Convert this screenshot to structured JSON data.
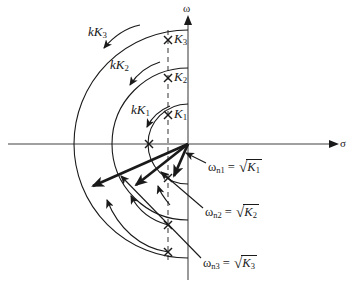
{
  "figure": {
    "kind": "root-locus-s-plane",
    "background_color": "#ffffff",
    "line_color": "#1a1a1a",
    "axis_color": "#808080",
    "axes": {
      "real_axis_label": "σ",
      "imag_axis_label": "ω",
      "origin": {
        "x": 188,
        "y": 144
      },
      "real_axis_arrow_x": 336,
      "imag_axis_arrow_y": 18,
      "dashed_line_x": 168
    },
    "pole_labels": [
      {
        "name": "K3",
        "base": "K",
        "subscript": "3",
        "x": 174,
        "y": 34,
        "mark_x": 168,
        "mark_y": 40
      },
      {
        "name": "K2",
        "base": "K",
        "subscript": "2",
        "x": 174,
        "y": 72,
        "mark_x": 168,
        "mark_y": 78
      },
      {
        "name": "K1",
        "base": "K",
        "subscript": "1",
        "x": 174,
        "y": 109,
        "mark_x": 168,
        "mark_y": 115
      }
    ],
    "gain_labels": [
      {
        "name": "kK3",
        "base": "kK",
        "subscript": "3",
        "x": 88,
        "y": 29
      },
      {
        "name": "kK2",
        "base": "kK",
        "subscript": "2",
        "x": 112,
        "y": 62
      },
      {
        "name": "kK1",
        "base": "kK",
        "subscript": "1",
        "x": 134,
        "y": 107
      }
    ],
    "natural_frequency_labels": [
      {
        "name": "omega-n1",
        "omega": "ω",
        "subscript": "n1",
        "equals": "=",
        "radical": "√",
        "radicand_base": "K",
        "radicand_sub": "1",
        "x": 208,
        "y": 166
      },
      {
        "name": "omega-n2",
        "omega": "ω",
        "subscript": "n2",
        "equals": "=",
        "radical": "√",
        "radicand_base": "K",
        "radicand_sub": "2",
        "x": 205,
        "y": 211
      },
      {
        "name": "omega-n3",
        "omega": "ω",
        "subscript": "n3",
        "equals": "=",
        "radical": "√",
        "radicand_base": "K",
        "radicand_sub": "3",
        "x": 203,
        "y": 262
      }
    ],
    "pole_crosses_lower": [
      {
        "name": "cross-n1",
        "x": 168,
        "y": 178
      },
      {
        "name": "cross-n2",
        "x": 168,
        "y": 225
      },
      {
        "name": "cross-n3",
        "x": 168,
        "y": 252
      }
    ],
    "real_axis_cross": {
      "name": "cross-real",
      "x": 149,
      "y": 144
    },
    "arcs": [
      {
        "name": "arc-K1",
        "radius": 40
      },
      {
        "name": "arc-K2",
        "radius": 76
      },
      {
        "name": "arc-K3",
        "radius": 114
      }
    ],
    "vectors": [
      {
        "name": "vector-omega-n1",
        "x2": 172,
        "y2": 174
      },
      {
        "name": "vector-omega-n2",
        "x2": 133,
        "y2": 185
      },
      {
        "name": "vector-omega-n3",
        "x2": 90,
        "y2": 187
      }
    ]
  }
}
